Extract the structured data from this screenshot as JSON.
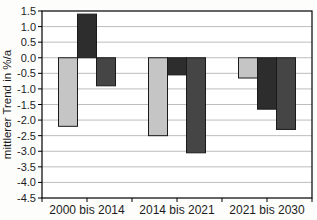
{
  "chart_data": {
    "type": "bar",
    "title": "",
    "ylabel": "mittlerer Trend in %/a",
    "xlabel": "",
    "ylim": [
      -4.5,
      1.5
    ],
    "ytick_step": 0.5,
    "yticks": [
      "1.5",
      "1.0",
      "0.5",
      "0.0",
      "-0.5",
      "-1.0",
      "-1.5",
      "-2.0",
      "-2.5",
      "-3.0",
      "-3.5",
      "-4.0",
      "-4.5"
    ],
    "categories": [
      "2000 bis 2014",
      "2014 bis 2021",
      "2021 bis 2030"
    ],
    "series": [
      {
        "name": "hellgrau",
        "color": "#c5c5c5",
        "values": [
          -2.2,
          -2.5,
          -0.65
        ]
      },
      {
        "name": "schwarz",
        "color": "#2d2d2d",
        "values": [
          1.4,
          -0.55,
          -1.65
        ]
      },
      {
        "name": "dunkelgrau",
        "color": "#454545",
        "values": [
          -0.9,
          -3.05,
          -2.3
        ]
      }
    ],
    "grid": true,
    "legend": "none",
    "colors": {
      "plot_background": "#ffffff",
      "gridline": "#bdbdbd",
      "frame": "#000000",
      "bar_outline": "#1a1a1a"
    }
  }
}
